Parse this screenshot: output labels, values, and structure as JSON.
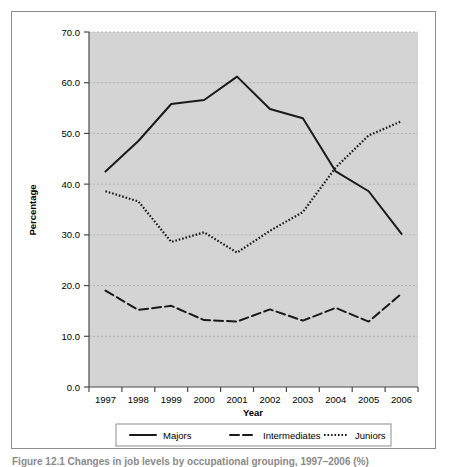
{
  "figure": {
    "caption": "Figure 12.1   Changes in job levels by occupational grouping, 1997–2006 (%)"
  },
  "chart_data": {
    "type": "line",
    "title": "",
    "xlabel": "Year",
    "ylabel": "Percentage",
    "categories": [
      "1997",
      "1998",
      "1999",
      "2000",
      "2001",
      "2002",
      "2003",
      "2004",
      "2005",
      "2006"
    ],
    "x": [
      1997,
      1998,
      1999,
      2000,
      2001,
      2002,
      2003,
      2004,
      2005,
      2006
    ],
    "xlim": [
      1996.5,
      2006.5
    ],
    "ylim": [
      0.0,
      70.0
    ],
    "ytick_labels": [
      "0.0",
      "10.0",
      "20.0",
      "30.0",
      "40.0",
      "50.0",
      "60.0",
      "70.0"
    ],
    "yticks": [
      0.0,
      10.0,
      20.0,
      30.0,
      40.0,
      50.0,
      60.0,
      70.0
    ],
    "grid": true,
    "grid_axis": "y",
    "legend_position": "bottom",
    "plot_background": "#d4d4d4",
    "series": [
      {
        "name": "Majors",
        "style": "solid",
        "color": "#1a1a1a",
        "values": [
          42.5,
          48.5,
          55.8,
          56.6,
          61.2,
          54.8,
          53.0,
          42.5,
          38.6,
          30.2
        ]
      },
      {
        "name": "Intermediates",
        "style": "dashed",
        "color": "#1a1a1a",
        "values": [
          19.0,
          15.2,
          16.0,
          13.2,
          12.9,
          15.3,
          13.1,
          15.6,
          12.9,
          18.4
        ]
      },
      {
        "name": "Juniors",
        "style": "dotted",
        "color": "#1a1a1a",
        "values": [
          38.6,
          36.6,
          28.6,
          30.5,
          26.5,
          30.8,
          34.5,
          43.3,
          49.6,
          52.4
        ]
      }
    ]
  }
}
